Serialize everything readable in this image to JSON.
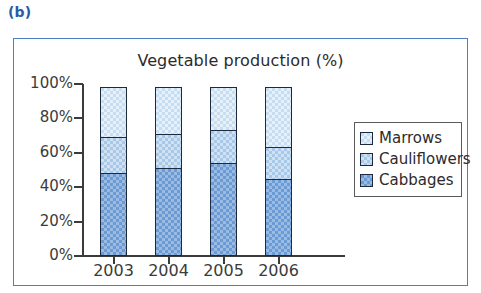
{
  "figure": {
    "label": "(b)"
  },
  "legend": {
    "items": [
      {
        "label": "Marrows",
        "color": "#c7ddf1",
        "swatch_name": "legend-swatch-marrows"
      },
      {
        "label": "Cauliflowers",
        "color": "#a8c8e8",
        "swatch_name": "legend-swatch-cauliflowers"
      },
      {
        "label": "Cabbages",
        "color": "#6b9bd4",
        "swatch_name": "legend-swatch-cabbages"
      }
    ]
  },
  "axes": {
    "y_ticks": [
      "100%",
      "80%",
      "60%",
      "40%",
      "20%",
      "0%"
    ],
    "x_ticks": [
      "2003",
      "2004",
      "2005",
      "2006"
    ]
  },
  "chart_data": {
    "type": "bar",
    "stacked": true,
    "title": "Vegetable production (%)",
    "subtitle": "",
    "xlabel": "",
    "ylabel": "",
    "categories": [
      "2003",
      "2004",
      "2005",
      "2006"
    ],
    "series": [
      {
        "name": "Cabbages",
        "color": "#6b9bd4",
        "values": [
          48,
          51,
          54,
          45
        ]
      },
      {
        "name": "Cauliflowers",
        "color": "#a8c8e8",
        "values": [
          22,
          21,
          20,
          19
        ]
      },
      {
        "name": "Marrows",
        "color": "#c7ddf1",
        "values": [
          30,
          28,
          26,
          36
        ]
      }
    ],
    "ylim": [
      0,
      100
    ],
    "ytick_values": [
      100,
      80,
      60,
      40,
      20,
      0
    ],
    "ytick_labels": [
      "100%",
      "80%",
      "60%",
      "40%",
      "20%",
      "0%"
    ],
    "grid": false,
    "legend_position": "right",
    "legend_order_top_to_bottom": [
      "Marrows",
      "Cauliflowers",
      "Cabbages"
    ],
    "cumulative_boundaries_percent": {
      "2003": [
        48,
        70,
        100
      ],
      "2004": [
        51,
        72,
        100
      ],
      "2005": [
        54,
        74,
        100
      ],
      "2006": [
        45,
        64,
        100
      ]
    }
  }
}
